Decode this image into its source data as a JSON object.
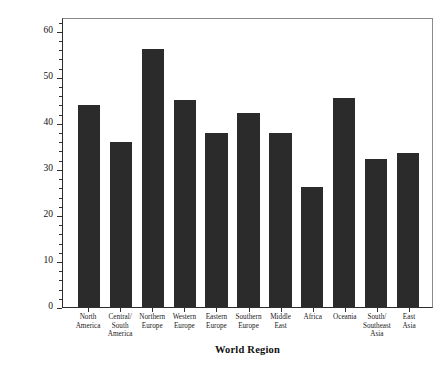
{
  "chart_data": {
    "type": "bar",
    "title": "",
    "xlabel": "World Region",
    "ylabel": "Percentage of Securely Attached Individuals",
    "ylim": [
      0,
      63
    ],
    "yticks": [
      0,
      10,
      20,
      30,
      40,
      50,
      60
    ],
    "ytick_labels": [
      "0",
      "10",
      "20",
      "30",
      "40",
      "50",
      "60"
    ],
    "grid": false,
    "legend": false,
    "bar_color": "#2b2b2b",
    "categories": [
      "North America",
      "Central/ South America",
      "Northern Europe",
      "Western Europe",
      "Eastern Europe",
      "Southern Europe",
      "Middle East",
      "Africa",
      "Oceania",
      "South/ Southeast Asia",
      "East Asia"
    ],
    "category_lines": [
      [
        "North",
        "America"
      ],
      [
        "Central/",
        "South",
        "America"
      ],
      [
        "Northern",
        "Europe"
      ],
      [
        "Western",
        "Europe"
      ],
      [
        "Eastern",
        "Europe"
      ],
      [
        "Southern",
        "Europe"
      ],
      [
        "Middle",
        "East"
      ],
      [
        "Africa"
      ],
      [
        "Oceania"
      ],
      [
        "South/",
        "Southeast",
        "Asia"
      ],
      [
        "East",
        "Asia"
      ]
    ],
    "values": [
      43.8,
      35.8,
      56.0,
      45.0,
      37.7,
      42.2,
      37.8,
      26.0,
      45.5,
      32.2,
      33.5
    ]
  }
}
